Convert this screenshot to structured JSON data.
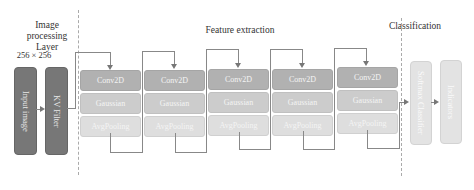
{
  "sections": {
    "image_processing": {
      "title_line1": "Image processing",
      "title_line2": "Layer"
    },
    "feature_extraction": {
      "title": "Feature extraction"
    },
    "classification": {
      "title": "Classification"
    }
  },
  "input_size": "256 × 256",
  "input_image": "Input image",
  "kv_filter": "KV Filter",
  "blocks": [
    {
      "conv": "Conv2D",
      "gauss": "Gaussian",
      "pool": "AvgPooling"
    },
    {
      "conv": "Conv2D",
      "gauss": "Gaussian",
      "pool": "AvgPooling"
    },
    {
      "conv": "Conv2D",
      "gauss": "Gaussian",
      "pool": "AvgPooling"
    },
    {
      "conv": "Conv2D",
      "gauss": "Gaussian",
      "pool": "AvgPooling"
    },
    {
      "conv": "Conv2D",
      "gauss": "Gaussian",
      "pool": "AvgPooling"
    }
  ],
  "classifier": "Softmax Classifier",
  "indicators": "Indicators",
  "colors": {
    "dark": "#777777",
    "conv": "#b1b1b1",
    "gauss": "#cccccc",
    "pool": "#dedede",
    "light": "#e3e3e3"
  }
}
